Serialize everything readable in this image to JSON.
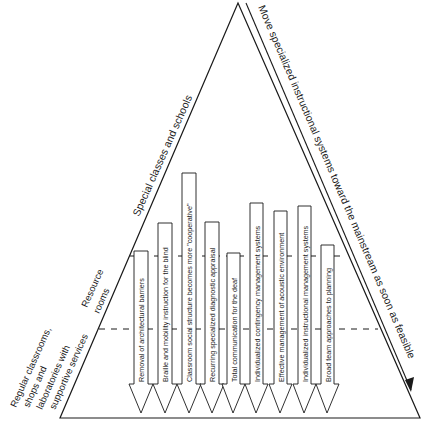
{
  "diagram": {
    "type": "cascade-triangle",
    "levels": [
      {
        "id": "special",
        "label": "Special classes and schools"
      },
      {
        "id": "resource",
        "label_lines": [
          "Resource",
          "rooms"
        ]
      },
      {
        "id": "regular",
        "label_lines": [
          "Regular classrooms,",
          "shops  and",
          "laboratories  with",
          "supportive services"
        ]
      }
    ],
    "side_arrow_label": "Move specialized instructional systems toward the mainstream as soon as feasible",
    "arrows": [
      {
        "label": "Removal of architectural barriers"
      },
      {
        "label": "Braille and mobility instruction for the blind"
      },
      {
        "label": "Classroom social structure becomes more \"cooperative\""
      },
      {
        "label": "Recurring specialized diagnostic appraisal"
      },
      {
        "label": "Total communication for the deaf"
      },
      {
        "label": "Individualized contingency management systems"
      },
      {
        "label": "Effective management of acoustic environment"
      },
      {
        "label": "Individualized instructional management systems"
      },
      {
        "label": "Broad team approaches to planning"
      }
    ],
    "colors": {
      "line": "#1a1a1a",
      "background": "#ffffff"
    }
  }
}
